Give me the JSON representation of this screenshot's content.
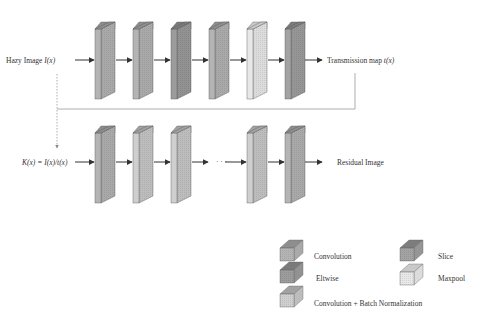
{
  "diagram": {
    "type": "network-architecture",
    "top_row": {
      "input_label": "Hazy Image ",
      "input_symbol": "I(x)",
      "output_label": "Transmission map ",
      "output_symbol": "t(x)",
      "blocks": [
        {
          "kind": "convolution",
          "x": 95
        },
        {
          "kind": "convolution",
          "x": 133
        },
        {
          "kind": "eltwise",
          "x": 171
        },
        {
          "kind": "convolution",
          "x": 209
        },
        {
          "kind": "maxpool",
          "x": 247
        },
        {
          "kind": "slice",
          "x": 285
        }
      ]
    },
    "bottom_row": {
      "input_label": "K(x) = I(x)/t(x)",
      "output_label": "Residual Image",
      "ellipsis": "· · ·",
      "blocks": [
        {
          "kind": "convolution",
          "x": 95
        },
        {
          "kind": "conv_bn",
          "x": 133
        },
        {
          "kind": "conv_bn",
          "x": 171
        },
        {
          "kind": "conv_bn",
          "x": 247
        },
        {
          "kind": "convolution",
          "x": 285
        }
      ]
    },
    "legend": [
      {
        "kind": "convolution",
        "label": "Convolution"
      },
      {
        "kind": "eltwise",
        "label": "Eltwise"
      },
      {
        "kind": "conv_bn",
        "label": "Convolution + Batch Normalization"
      },
      {
        "kind": "slice",
        "label": "Slice"
      },
      {
        "kind": "maxpool",
        "label": "Maxpool"
      }
    ],
    "colors": {
      "convolution": {
        "front": "#b4b4b4",
        "side": "#a9a9a9",
        "top": "#8e8e8e"
      },
      "eltwise": {
        "front": "#9c9c9c",
        "side": "#929292",
        "top": "#7a7a7a"
      },
      "conv_bn": {
        "front": "#cfcfcf",
        "side": "#bdbdbd",
        "top": "#a2a2a2"
      },
      "slice": {
        "front": "#a3a3a3",
        "side": "#969696",
        "top": "#7d7d7d"
      },
      "maxpool": {
        "front": "#e8e8e8",
        "side": "#dcdcdc",
        "top": "#c9c9c9"
      },
      "line": "#333333",
      "feedback_line": "#9a9a9a"
    }
  }
}
